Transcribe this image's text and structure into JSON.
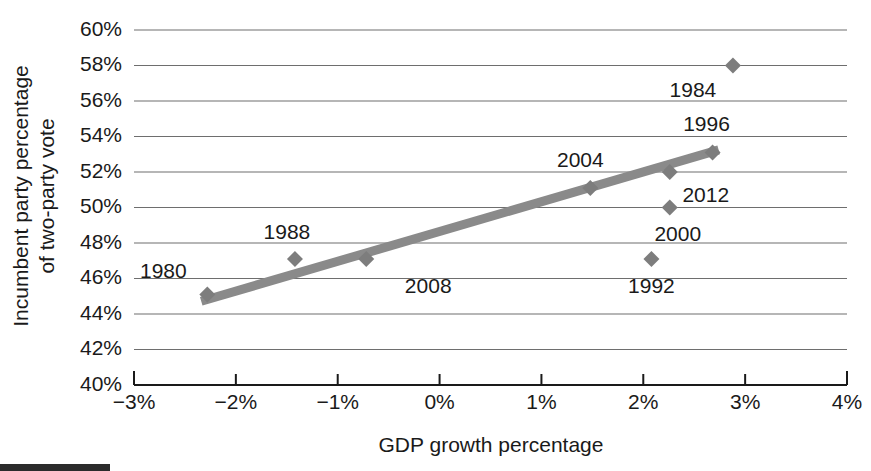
{
  "chart_data": {
    "type": "scatter",
    "title": "",
    "xlabel": "GDP growth percentage",
    "ylabel": "Incumbent party percentage of two-party vote",
    "ylabel_line1": "Incumbent party percentage",
    "ylabel_line2": "of two-party vote",
    "xlim": [
      -3,
      4
    ],
    "ylim": [
      40,
      60
    ],
    "x_ticks": [
      -3,
      -2,
      -1,
      0,
      1,
      2,
      3,
      4
    ],
    "x_tick_labels": [
      "−3%",
      "−2%",
      "−1%",
      "0%",
      "1%",
      "2%",
      "3%",
      "4%"
    ],
    "y_ticks": [
      40,
      42,
      44,
      46,
      48,
      50,
      52,
      54,
      56,
      58,
      60
    ],
    "y_tick_labels": [
      "40%",
      "42%",
      "44%",
      "46%",
      "48%",
      "50%",
      "52%",
      "54%",
      "56%",
      "58%",
      "60%"
    ],
    "grid": true,
    "legend": "none",
    "marker_color": "#7d7d7d",
    "fitline_color": "#8a8a8a",
    "grid_color": "#6e6e6e",
    "axis_color": "#1a1a1a",
    "points": [
      {
        "label": "1980",
        "x": -2.28,
        "y": 45.1,
        "label_dx": -44,
        "label_dy": -22
      },
      {
        "label": "1988",
        "x": -1.42,
        "y": 47.1,
        "label_dx": -8,
        "label_dy": -26
      },
      {
        "label": "2008",
        "x": -0.72,
        "y": 47.1,
        "label_dx": 62,
        "label_dy": 28
      },
      {
        "label": "2004",
        "x": 1.48,
        "y": 51.1,
        "label_dx": -10,
        "label_dy": -27
      },
      {
        "label": "1992",
        "x": 2.08,
        "y": 47.1,
        "label_dx": 0,
        "label_dy": 28
      },
      {
        "label": "2000",
        "x": 2.26,
        "y": 50.0,
        "label_dx": 8,
        "label_dy": 28
      },
      {
        "label": "2012",
        "x": 2.26,
        "y": 52.0,
        "label_dx": 36,
        "label_dy": 24
      },
      {
        "label": "1996",
        "x": 2.68,
        "y": 53.1,
        "label_dx": -6,
        "label_dy": -27
      },
      {
        "label": "1984",
        "x": 2.88,
        "y": 58.0,
        "label_dx": -40,
        "label_dy": 26
      }
    ],
    "fitline": {
      "x_start": -2.34,
      "y_start": 44.72,
      "x_end": 2.74,
      "y_end": 53.25
    }
  }
}
